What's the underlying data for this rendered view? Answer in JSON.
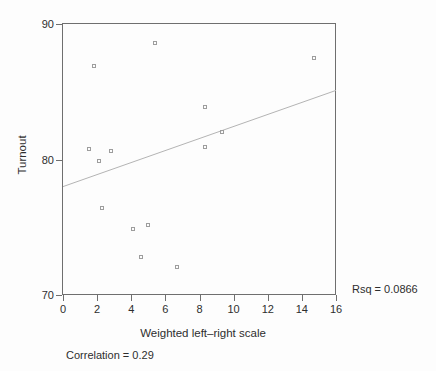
{
  "chart_data": {
    "type": "scatter",
    "title": "",
    "xlabel": "Weighted left–right scale",
    "ylabel": "Turnout",
    "xlim": [
      0,
      16
    ],
    "ylim": [
      70,
      90
    ],
    "x_ticks": [
      "0",
      "2",
      "4",
      "6",
      "8",
      "10",
      "12",
      "14",
      "16"
    ],
    "x_tick_values": [
      0,
      2,
      4,
      6,
      8,
      10,
      12,
      14,
      16
    ],
    "y_ticks": [
      "90",
      "80",
      "70"
    ],
    "y_tick_values": [
      90,
      80,
      70
    ],
    "grid": false,
    "legend": "none",
    "marker": "hollow-square",
    "points": [
      [
        1.5,
        80.8
      ],
      [
        1.8,
        86.9
      ],
      [
        2.1,
        79.9
      ],
      [
        2.3,
        76.4
      ],
      [
        2.8,
        80.6
      ],
      [
        4.1,
        74.9
      ],
      [
        4.6,
        72.8
      ],
      [
        5.0,
        75.2
      ],
      [
        5.4,
        88.6
      ],
      [
        6.7,
        72.1
      ],
      [
        8.3,
        83.9
      ],
      [
        8.3,
        80.9
      ],
      [
        9.3,
        82.0
      ],
      [
        14.7,
        87.5
      ]
    ],
    "fit_line": {
      "x0": 0,
      "y0": 78.0,
      "x1": 16,
      "y1": 85.1
    },
    "annotations": {
      "rsq": "Rsq = 0.0866",
      "correlation": "Correlation = 0.29"
    }
  },
  "colors": {
    "background": "#fdfdfd",
    "axis": "#6f6f6f",
    "text": "#2e2e2e",
    "marker": "#9d9d9d",
    "fit_line": "#b4b4b4"
  }
}
